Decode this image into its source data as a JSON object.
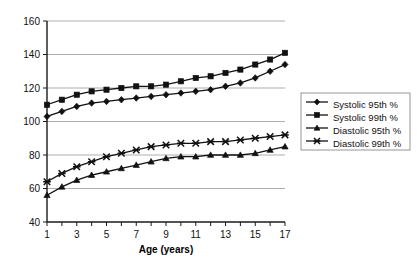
{
  "chart_data": {
    "type": "line",
    "title": "",
    "xlabel": "Age (years)",
    "ylabel": "",
    "xlim": [
      1,
      17
    ],
    "ylim": [
      40,
      160
    ],
    "ytick_step": 20,
    "grid": true,
    "legend_position": "right",
    "x": [
      1,
      2,
      3,
      4,
      5,
      6,
      7,
      8,
      9,
      10,
      11,
      12,
      13,
      14,
      15,
      16,
      17
    ],
    "xtick_labels": [
      "1",
      "3",
      "5",
      "7",
      "9",
      "11",
      "13",
      "15",
      "17"
    ],
    "ytick_labels": [
      "40",
      "60",
      "80",
      "100",
      "120",
      "140",
      "160"
    ],
    "series": [
      {
        "name": "Systolic 95th %",
        "marker": "diamond",
        "values": [
          103,
          106,
          109,
          111,
          112,
          113,
          114,
          115,
          116,
          117,
          118,
          119,
          121,
          123,
          126,
          130,
          134
        ]
      },
      {
        "name": "Systolic 99th %",
        "marker": "square",
        "values": [
          110,
          113,
          116,
          118,
          119,
          120,
          121,
          121,
          122,
          124,
          126,
          127,
          129,
          131,
          134,
          137,
          141
        ]
      },
      {
        "name": "Diastolic 95th %",
        "marker": "triangle",
        "values": [
          56,
          61,
          65,
          68,
          70,
          72,
          74,
          76,
          78,
          79,
          79,
          80,
          80,
          80,
          81,
          83,
          85
        ]
      },
      {
        "name": "Diastolic 99th %",
        "marker": "cross",
        "values": [
          64,
          69,
          73,
          76,
          79,
          81,
          83,
          85,
          86,
          87,
          87,
          88,
          88,
          89,
          90,
          91,
          92
        ]
      }
    ],
    "colors": {
      "line": "#111111",
      "grid": "#9a9a9a",
      "axis": "#1a1a1a",
      "background": "#ffffff"
    }
  },
  "legend": {
    "items": [
      {
        "label": "Systolic 95th %",
        "marker": "diamond"
      },
      {
        "label": "Systolic 99th %",
        "marker": "square"
      },
      {
        "label": "Diastolic 95th %",
        "marker": "triangle"
      },
      {
        "label": "Diastolic 99th %",
        "marker": "cross"
      }
    ]
  },
  "axes": {
    "x_title": "Age (years)"
  }
}
